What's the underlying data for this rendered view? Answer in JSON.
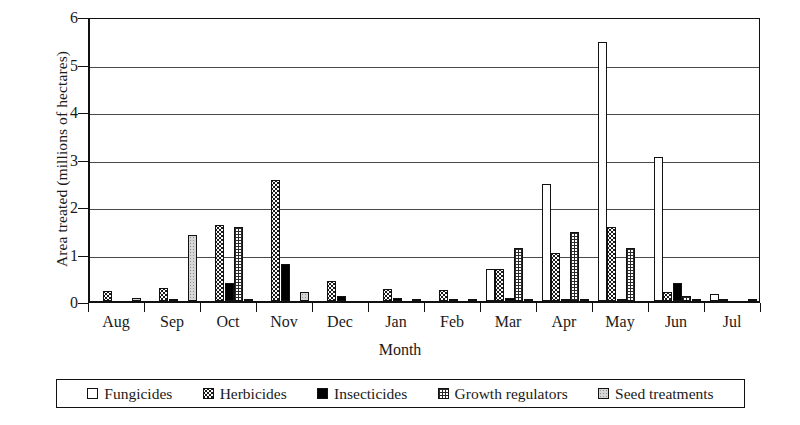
{
  "chart_data": {
    "type": "bar",
    "title": "",
    "xlabel": "Month",
    "ylabel": "Area treated (millions of hectares)",
    "ylim": [
      0,
      6
    ],
    "yticks": [
      "0",
      "1",
      "2",
      "3",
      "4",
      "5",
      "6"
    ],
    "grid": true,
    "legend_position": "bottom",
    "categories": [
      "Aug",
      "Sep",
      "Oct",
      "Nov",
      "Dec",
      "Jan",
      "Feb",
      "Mar",
      "Apr",
      "May",
      "Jun",
      "Jul"
    ],
    "series": [
      {
        "name": "Fungicides",
        "pattern": "open-white",
        "color": "#ffffff",
        "values": [
          0,
          0,
          0,
          0,
          0,
          0,
          0,
          0.68,
          2.47,
          5.45,
          3.03,
          0.15
        ]
      },
      {
        "name": "Herbicides",
        "pattern": "dotted",
        "color": "#ffffff",
        "values": [
          0.21,
          0.27,
          1.6,
          2.55,
          0.43,
          0.25,
          0.24,
          0.68,
          1.02,
          1.55,
          0.2,
          0.05
        ]
      },
      {
        "name": "Insecticides",
        "pattern": "solid-black",
        "color": "#000000",
        "values": [
          0,
          0.01,
          0.38,
          0.78,
          0.1,
          0.06,
          0.05,
          0.07,
          0.03,
          0.05,
          0.38,
          0
        ]
      },
      {
        "name": "Growth regulators",
        "pattern": "cross-hatch",
        "color": "#ffffff",
        "values": [
          0,
          0,
          1.55,
          0,
          0,
          0,
          0,
          1.12,
          1.45,
          1.12,
          0.1,
          0
        ]
      },
      {
        "name": "Seed treatments",
        "pattern": "light-stipple",
        "color": "#d6d6d6",
        "values": [
          0.07,
          1.4,
          0.02,
          0.2,
          0,
          0.04,
          0.02,
          0.02,
          0.02,
          0,
          0.02,
          0.04
        ]
      }
    ]
  },
  "legend": {
    "items": [
      {
        "label": "Fungicides"
      },
      {
        "label": "Herbicides"
      },
      {
        "label": "Insecticides"
      },
      {
        "label": "Growth regulators"
      },
      {
        "label": "Seed treatments"
      }
    ]
  }
}
